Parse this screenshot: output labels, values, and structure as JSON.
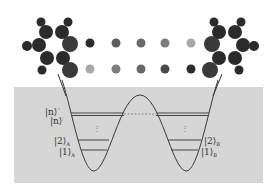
{
  "figure": {
    "colors": {
      "panel": "#d6d6d6",
      "curve": "#3a3a3a",
      "level": "#444444",
      "atom_dark": "#2b2b2b",
      "atom_mid": "#6a6a6a",
      "atom_light": "#a8a8a8"
    },
    "bridge_top_row": [
      "dark",
      "mid",
      "mid",
      "mid-light",
      "light"
    ],
    "bridge_bottom_row": [
      "light",
      "mid",
      "mid",
      "mid-dark",
      "dark"
    ],
    "labels": {
      "left": {
        "n_double_prime": {
          "base": "|n⟩",
          "sup": "''"
        },
        "n": {
          "base": "|n⟩",
          "sup": "'"
        },
        "two": {
          "base": "|2⟩",
          "sub": "A"
        },
        "one": {
          "base": "|1⟩",
          "sub": "A"
        }
      },
      "right": {
        "two": {
          "base": "|2⟩",
          "sub": "B"
        },
        "one": {
          "base": "|1⟩",
          "sub": "B"
        }
      },
      "dots": "⋮"
    }
  }
}
